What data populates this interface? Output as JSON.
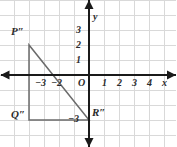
{
  "figure": {
    "type": "coordinate-plane",
    "background_color": "#ffffff",
    "grid_color": "#d9d9d9",
    "axis_color": "#1a1a1a",
    "shape_color": "#6b6b6b",
    "text_color": "#2b2b2b",
    "origin_px": {
      "x": 89,
      "y": 75
    },
    "unit_px": 15
  },
  "axes": {
    "x_label": "x",
    "y_label": "y",
    "origin_label": "O",
    "x_ticks": [
      {
        "value": -3,
        "label": "−3",
        "px": 44
      },
      {
        "value": -2,
        "label": "−2",
        "px": 59
      },
      {
        "value": 1,
        "label": "1",
        "px": 104
      },
      {
        "value": 2,
        "label": "2",
        "px": 119
      },
      {
        "value": 3,
        "label": "3",
        "px": 134
      },
      {
        "value": 4,
        "label": "4",
        "px": 149
      }
    ],
    "y_ticks": [
      {
        "value": 3,
        "label": "3",
        "px": 30
      },
      {
        "value": 2,
        "label": "2",
        "px": 45
      },
      {
        "value": 1,
        "label": "1",
        "px": 60
      },
      {
        "value": -3,
        "label": "−3",
        "px": 120
      }
    ],
    "x_range": [
      -5.9,
      5.8
    ],
    "y_range": [
      -4.8,
      5.0
    ]
  },
  "shape": {
    "name": "triangle-p-q-r-double-prime",
    "kind": "right-triangle",
    "vertices": [
      {
        "name": "P″",
        "label": "P″",
        "x": -4,
        "y": 2,
        "label_px": {
          "x": 11,
          "y": 26
        }
      },
      {
        "name": "Q″",
        "label": "Q″",
        "x": -4,
        "y": -3,
        "label_px": {
          "x": 11,
          "y": 109
        }
      },
      {
        "name": "R″",
        "label": "R″",
        "x": 0,
        "y": -3,
        "label_px": {
          "x": 92,
          "y": 107
        }
      }
    ],
    "edges": [
      {
        "from": "P″",
        "to": "Q″"
      },
      {
        "from": "Q″",
        "to": "R″"
      },
      {
        "from": "R″",
        "to": "P″"
      }
    ]
  },
  "chart_data": {
    "type": "scatter",
    "title": "",
    "xlabel": "x",
    "ylabel": "y",
    "xlim": [
      -5.9,
      5.8
    ],
    "ylim": [
      -4.8,
      5.0
    ],
    "grid": true,
    "legend": "none",
    "series": [
      {
        "name": "Triangle P″Q″R″",
        "closed": true,
        "point_labels": [
          "P″",
          "Q″",
          "R″"
        ],
        "x": [
          -4,
          -4,
          0
        ],
        "y": [
          2,
          -3,
          -3
        ]
      }
    ],
    "xticks": [
      -3,
      -2,
      1,
      2,
      3,
      4
    ],
    "xticklabels": [
      "−3",
      "−2",
      "1",
      "2",
      "3",
      "4"
    ],
    "yticks": [
      3,
      2,
      1,
      -3
    ],
    "yticklabels": [
      "3",
      "2",
      "1",
      "−3"
    ]
  }
}
